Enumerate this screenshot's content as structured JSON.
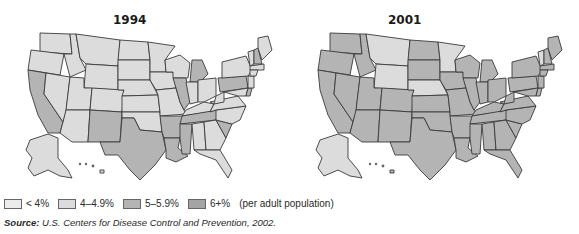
{
  "figure": {
    "maps": [
      {
        "title": "1994"
      },
      {
        "title": "2001"
      }
    ],
    "legend": {
      "items": [
        {
          "label": "< 4%",
          "color": "#ececec"
        },
        {
          "label": "4–4.9%",
          "color": "#dcdcdc"
        },
        {
          "label": "5–5.9%",
          "color": "#b4b4b4"
        },
        {
          "label": "6+%",
          "color": "#a4a4a4"
        }
      ],
      "note": "(per adult population)"
    },
    "source": {
      "label": "Source:",
      "text": "U.S. Centers for Disease Control and Prevention, 2002."
    }
  },
  "map_data": {
    "1994": {
      "darker_5_5.9": [
        "CA",
        "NM",
        "TX",
        "LA",
        "AR",
        "MS",
        "TN",
        "IL",
        "MI",
        "SC",
        "PA",
        "NH",
        "DE"
      ],
      "light_4_4.9": [
        "remaining states"
      ]
    },
    "2001": {
      "light_4_4.9": [
        "MT",
        "WY",
        "NE",
        "MN",
        "VT",
        "AK"
      ],
      "darker_5_5.9_and_6+": [
        "remaining states"
      ]
    }
  }
}
